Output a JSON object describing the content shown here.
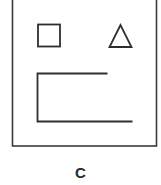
{
  "figure": {
    "caption": "C",
    "stroke_color": "#333333",
    "background": "#ffffff",
    "shapes": [
      {
        "type": "square",
        "label": "square"
      },
      {
        "type": "triangle",
        "label": "triangle"
      },
      {
        "type": "bracket",
        "label": "open rectangle (bracket)"
      }
    ]
  }
}
